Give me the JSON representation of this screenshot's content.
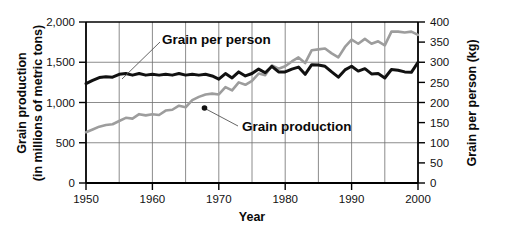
{
  "chart_data": {
    "type": "line",
    "title": "",
    "xlabel": "Year",
    "grid": true,
    "legend_position": "inline-annotations",
    "x_axis": {
      "label": "Year",
      "min": 1950,
      "max": 2000,
      "tick_labels": [
        "1950",
        "1960",
        "1970",
        "1980",
        "1990",
        "2000"
      ],
      "tick_values": [
        1950,
        1960,
        1970,
        1980,
        1990,
        2000
      ],
      "gridline_values": [
        1955,
        1960,
        1965,
        1970,
        1975,
        1980,
        1985,
        1990,
        1995
      ]
    },
    "y_axis_left": {
      "label": "Grain production",
      "label_line2": "(in millions of metric tons)",
      "units": "millions of metric tons",
      "min": 0,
      "max": 2000,
      "tick_labels": [
        "0",
        "500",
        "1,000",
        "1,500",
        "2,000"
      ],
      "tick_values": [
        0,
        500,
        1000,
        1500,
        2000
      ]
    },
    "y_axis_right": {
      "label": "Grain per person (kg)",
      "units": "kg",
      "min": 0,
      "max": 400,
      "tick_labels": [
        "0",
        "50",
        "100",
        "150",
        "200",
        "250",
        "300",
        "350",
        "400"
      ],
      "tick_values": [
        0,
        50,
        100,
        150,
        200,
        250,
        300,
        350,
        400
      ]
    },
    "series": [
      {
        "name": "Grain production",
        "axis": "left",
        "color": "#9d9d9d",
        "annotation": "Grain production",
        "annotation_point": [
          1966,
          990
        ],
        "x": [
          1950,
          1951,
          1952,
          1953,
          1954,
          1955,
          1956,
          1957,
          1958,
          1959,
          1960,
          1961,
          1962,
          1963,
          1964,
          1965,
          1966,
          1967,
          1968,
          1969,
          1970,
          1971,
          1972,
          1973,
          1974,
          1975,
          1976,
          1977,
          1978,
          1979,
          1980,
          1981,
          1982,
          1983,
          1984,
          1985,
          1986,
          1987,
          1988,
          1989,
          1990,
          1991,
          1992,
          1993,
          1994,
          1995,
          1996,
          1997,
          1998,
          1999,
          2000
        ],
        "values": [
          631,
          665,
          700,
          720,
          730,
          770,
          810,
          800,
          855,
          840,
          855,
          845,
          900,
          910,
          960,
          940,
          1030,
          1070,
          1100,
          1110,
          1100,
          1190,
          1150,
          1250,
          1220,
          1270,
          1360,
          1340,
          1460,
          1420,
          1450,
          1510,
          1560,
          1490,
          1650,
          1660,
          1670,
          1610,
          1560,
          1690,
          1780,
          1730,
          1790,
          1730,
          1760,
          1710,
          1880,
          1880,
          1870,
          1880,
          1840
        ]
      },
      {
        "name": "Grain per person",
        "axis": "right",
        "color": "#111111",
        "annotation": "Grain per person",
        "annotation_point": [
          1954,
          1305
        ],
        "x": [
          1950,
          1951,
          1952,
          1953,
          1954,
          1955,
          1956,
          1957,
          1958,
          1959,
          1960,
          1961,
          1962,
          1963,
          1964,
          1965,
          1966,
          1967,
          1968,
          1969,
          1970,
          1971,
          1972,
          1973,
          1974,
          1975,
          1976,
          1977,
          1978,
          1979,
          1980,
          1981,
          1982,
          1983,
          1984,
          1985,
          1986,
          1987,
          1988,
          1989,
          1990,
          1991,
          1992,
          1993,
          1994,
          1995,
          1996,
          1997,
          1998,
          1999,
          2000
        ],
        "values": [
          247,
          255,
          262,
          264,
          263,
          270,
          272,
          268,
          272,
          268,
          270,
          268,
          270,
          268,
          272,
          268,
          270,
          268,
          270,
          266,
          258,
          272,
          261,
          276,
          266,
          272,
          283,
          274,
          290,
          276,
          276,
          283,
          288,
          270,
          294,
          293,
          290,
          276,
          263,
          281,
          290,
          278,
          284,
          271,
          272,
          261,
          282,
          280,
          276,
          275,
          300
        ]
      }
    ]
  },
  "annotations": {
    "grain_per_person_label": "Grain per person",
    "grain_production_label": "Grain production"
  }
}
